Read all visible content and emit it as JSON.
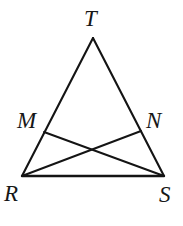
{
  "figure": {
    "kind": "geometry-diagram",
    "background_color": "#ffffff",
    "stroke_color": "#141414",
    "width": 183,
    "height": 226,
    "points": [
      {
        "id": "T",
        "label": "T",
        "x": 93,
        "y": 38,
        "label_x": 84,
        "label_y": 7
      },
      {
        "id": "M",
        "label": "M",
        "x": 44,
        "y": 132,
        "label_x": 17,
        "label_y": 109
      },
      {
        "id": "N",
        "label": "N",
        "x": 141,
        "y": 131,
        "label_x": 146,
        "label_y": 109
      },
      {
        "id": "R",
        "label": "R",
        "x": 22,
        "y": 176,
        "label_x": 4,
        "label_y": 182
      },
      {
        "id": "S",
        "label": "S",
        "x": 164,
        "y": 176,
        "label_x": 159,
        "label_y": 183
      }
    ],
    "segments": [
      {
        "id": "TR",
        "from": "T",
        "to": "R",
        "role": "triangle-side",
        "x1": 93,
        "y1": 38,
        "x2": 22,
        "y2": 176
      },
      {
        "id": "TS",
        "from": "T",
        "to": "S",
        "role": "triangle-side",
        "x1": 93,
        "y1": 38,
        "x2": 164,
        "y2": 176
      },
      {
        "id": "RS",
        "from": "R",
        "to": "S",
        "role": "triangle-base",
        "x1": 22,
        "y1": 176,
        "x2": 164,
        "y2": 176
      },
      {
        "id": "MS",
        "from": "M",
        "to": "S",
        "role": "cevian",
        "x1": 44,
        "y1": 132,
        "x2": 164,
        "y2": 176
      },
      {
        "id": "NR",
        "from": "N",
        "to": "R",
        "role": "cevian",
        "x1": 141,
        "y1": 131,
        "x2": 22,
        "y2": 176
      }
    ],
    "intersection": {
      "id": "MS-NR-crossing",
      "x": 92,
      "y": 152
    }
  }
}
